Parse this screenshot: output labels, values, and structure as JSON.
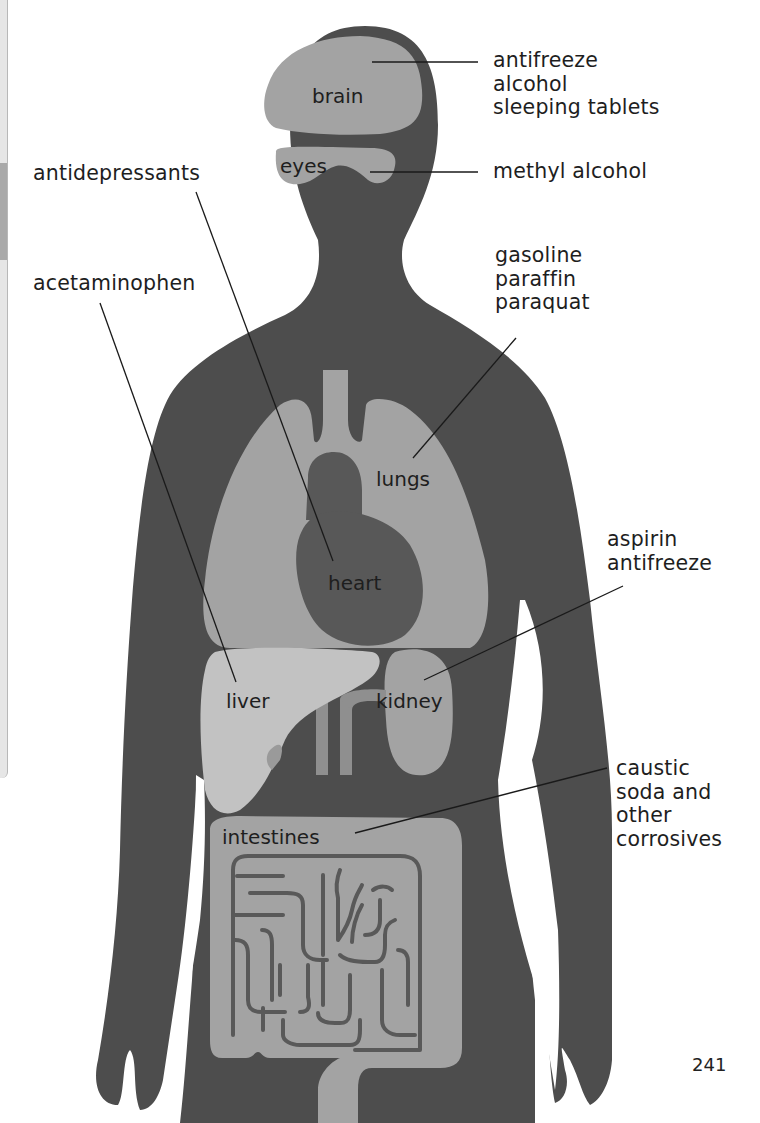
{
  "page": {
    "page_number": "241",
    "colors": {
      "background": "#ffffff",
      "body_silhouette": "#4d4d4d",
      "organ_fill": "#a3a3a3",
      "liver_fill": "#c2c2c2",
      "heart_fill": "#585858",
      "leader_line": "#1a1a1a",
      "text": "#1e1e1e"
    }
  },
  "diagram": {
    "title_hidden": "Organs affected by poisons",
    "organs": [
      {
        "id": "brain",
        "label": "brain"
      },
      {
        "id": "eyes",
        "label": "eyes"
      },
      {
        "id": "lungs",
        "label": "lungs"
      },
      {
        "id": "heart",
        "label": "heart"
      },
      {
        "id": "liver",
        "label": "liver"
      },
      {
        "id": "kidney",
        "label": "kidney"
      },
      {
        "id": "intestines",
        "label": "intestines"
      }
    ],
    "poison_groups": [
      {
        "organ": "brain",
        "poisons": [
          "antifreeze",
          "alcohol",
          "sleeping tablets"
        ]
      },
      {
        "organ": "eyes",
        "poisons": [
          "methyl alcohol"
        ]
      },
      {
        "organ": "heart",
        "poisons": [
          "antidepressants"
        ]
      },
      {
        "organ": "liver",
        "poisons": [
          "acetaminophen"
        ]
      },
      {
        "organ": "lungs",
        "poisons": [
          "gasoline",
          "paraffin",
          "paraquat"
        ]
      },
      {
        "organ": "kidney",
        "poisons": [
          "aspirin",
          "antifreeze"
        ]
      },
      {
        "organ": "intestines",
        "poisons": [
          "caustic",
          "soda and",
          "other",
          "corrosives"
        ]
      }
    ]
  }
}
